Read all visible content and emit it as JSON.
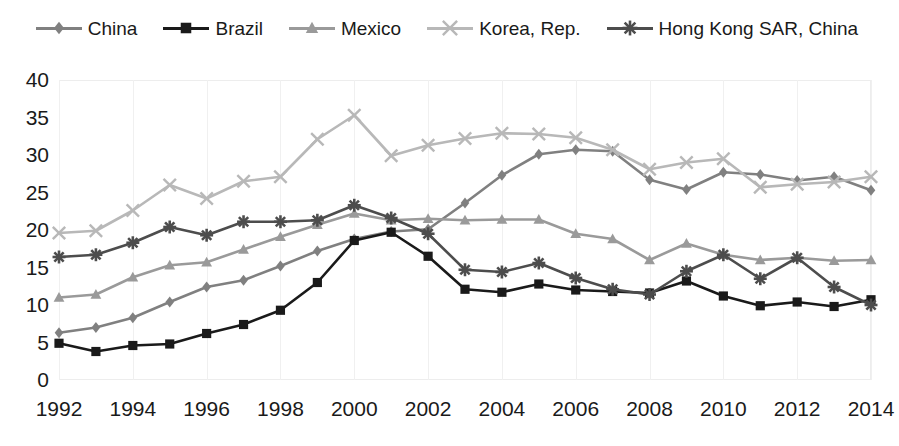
{
  "chart_data": {
    "type": "line",
    "title": "",
    "xlabel": "",
    "ylabel": "",
    "xlim": [
      1992,
      2014
    ],
    "ylim": [
      0,
      40
    ],
    "ytick_step": 5,
    "xtick_step": 2,
    "grid": "vertical",
    "legend_position": "top-center",
    "x": [
      1992,
      1993,
      1994,
      1995,
      1996,
      1997,
      1998,
      1999,
      2000,
      2001,
      2002,
      2003,
      2004,
      2005,
      2006,
      2007,
      2008,
      2009,
      2010,
      2011,
      2012,
      2013,
      2014
    ],
    "xtick_labels": [
      "1992",
      "1994",
      "1996",
      "1998",
      "2000",
      "2002",
      "2004",
      "2006",
      "2008",
      "2010",
      "2012",
      "2014"
    ],
    "ytick_labels": [
      "0",
      "5",
      "10",
      "15",
      "20",
      "25",
      "30",
      "35",
      "40"
    ],
    "series": [
      {
        "name": "China",
        "color": "#808080",
        "marker": "diamond",
        "values": [
          6.3,
          7.0,
          8.3,
          10.4,
          12.4,
          13.3,
          15.2,
          17.2,
          18.8,
          19.8,
          20.1,
          23.6,
          27.3,
          30.1,
          30.7,
          30.5,
          26.7,
          25.4,
          27.7,
          27.4,
          26.6,
          27.1,
          25.3
        ]
      },
      {
        "name": "Brazil",
        "color": "#1a1a1a",
        "marker": "square",
        "values": [
          4.9,
          3.8,
          4.6,
          4.8,
          6.2,
          7.4,
          9.3,
          13.0,
          18.6,
          19.7,
          16.5,
          12.1,
          11.7,
          12.8,
          12.0,
          11.8,
          11.6,
          13.2,
          11.2,
          9.9,
          10.4,
          9.8,
          10.7
        ]
      },
      {
        "name": "Mexico",
        "color": "#9a9a9a",
        "marker": "triangle",
        "values": [
          11.0,
          11.4,
          13.7,
          15.3,
          15.7,
          17.4,
          19.1,
          20.7,
          22.2,
          21.3,
          21.5,
          21.3,
          21.4,
          21.4,
          19.5,
          18.8,
          16.0,
          18.2,
          16.7,
          16.0,
          16.3,
          15.9,
          16.0
        ]
      },
      {
        "name": "Korea, Rep.",
        "color": "#b8b8b8",
        "marker": "cross",
        "values": [
          19.6,
          19.9,
          22.6,
          26.0,
          24.2,
          26.5,
          27.1,
          32.1,
          35.3,
          29.9,
          31.3,
          32.2,
          32.9,
          32.8,
          32.3,
          30.7,
          28.1,
          29.0,
          29.5,
          25.7,
          26.1,
          26.4,
          27.1
        ]
      },
      {
        "name": "Hong Kong SAR, China",
        "color": "#4d4d4d",
        "marker": "asterisk",
        "values": [
          16.4,
          16.7,
          18.3,
          20.4,
          19.3,
          21.1,
          21.1,
          21.3,
          23.3,
          21.6,
          19.5,
          14.7,
          14.4,
          15.6,
          13.6,
          12.1,
          11.4,
          14.5,
          16.7,
          13.5,
          16.3,
          12.4,
          10.0
        ]
      }
    ]
  },
  "legend": {
    "items": [
      {
        "label": "China",
        "icon": "diamond-marker-icon"
      },
      {
        "label": "Brazil",
        "icon": "square-marker-icon"
      },
      {
        "label": "Mexico",
        "icon": "triangle-marker-icon"
      },
      {
        "label": "Korea, Rep.",
        "icon": "cross-marker-icon"
      },
      {
        "label": "Hong Kong SAR, China",
        "icon": "asterisk-marker-icon"
      }
    ]
  }
}
